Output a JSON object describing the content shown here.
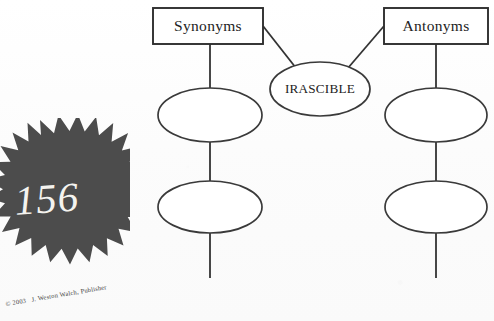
{
  "page": {
    "background_color": "#fdfdfd",
    "width": 494,
    "height": 321
  },
  "badge": {
    "name": "page-number-starburst",
    "number": "156",
    "fill_color": "#4c4c4c",
    "text_color": "#f4f3ef"
  },
  "copyright": {
    "text": "© 2003   J. Weston Walch, Publisher"
  },
  "diagram": {
    "type": "word-map",
    "title": "",
    "center_node": {
      "label": "IRASCIBLE",
      "shape": "ellipse"
    },
    "branches": [
      {
        "heading": "Synonyms",
        "shape": "rect",
        "side": "left",
        "blanks": [
          {
            "label": "",
            "shape": "ellipse"
          },
          {
            "label": "",
            "shape": "ellipse"
          }
        ]
      },
      {
        "heading": "Antonyms",
        "shape": "rect",
        "side": "right",
        "blanks": [
          {
            "label": "",
            "shape": "ellipse"
          },
          {
            "label": "",
            "shape": "ellipse"
          }
        ]
      }
    ],
    "stroke_color": "#333333",
    "fill_color": "#ffffff"
  }
}
